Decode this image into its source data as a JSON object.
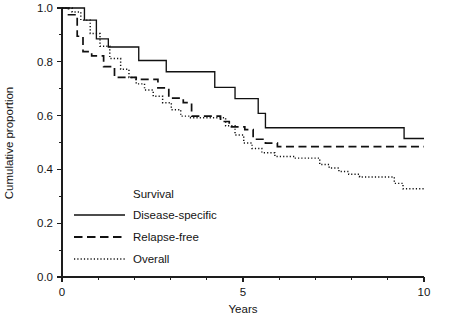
{
  "chart_data": {
    "type": "line",
    "title": "",
    "xlabel": "Years",
    "ylabel": "Cumulative proportion",
    "xlim": [
      0,
      10
    ],
    "ylim": [
      0.0,
      1.0
    ],
    "grid": false,
    "legend_position": "inside-lower-left",
    "legend_title": "Survival",
    "x_ticks_major": [
      0,
      5,
      10
    ],
    "x_tick_labels": [
      "0",
      "5",
      "10"
    ],
    "x_ticks_minor": [
      1,
      2,
      3,
      4,
      6,
      7,
      8,
      9
    ],
    "y_ticks_major": [
      0.0,
      0.2,
      0.4,
      0.6,
      0.8,
      1.0
    ],
    "y_tick_labels": [
      "0.0",
      "0.2",
      "0.4",
      "0.6",
      "0.8",
      "1.0"
    ],
    "y_ticks_minor": [
      0.1,
      0.3,
      0.5,
      0.7,
      0.9
    ],
    "curve_style": "kaplan-meier-step",
    "series": [
      {
        "name": "Disease-specific",
        "style": "solid",
        "color": "#111111",
        "points": [
          [
            0.0,
            1.0
          ],
          [
            0.42,
            1.0
          ],
          [
            0.62,
            0.955
          ],
          [
            0.95,
            0.885
          ],
          [
            1.28,
            0.855
          ],
          [
            1.95,
            0.855
          ],
          [
            2.12,
            0.805
          ],
          [
            2.72,
            0.805
          ],
          [
            2.88,
            0.763
          ],
          [
            4.05,
            0.763
          ],
          [
            4.22,
            0.705
          ],
          [
            4.62,
            0.705
          ],
          [
            4.78,
            0.663
          ],
          [
            5.25,
            0.663
          ],
          [
            5.42,
            0.608
          ],
          [
            5.62,
            0.555
          ],
          [
            9.28,
            0.555
          ],
          [
            9.45,
            0.515
          ],
          [
            10.0,
            0.515
          ]
        ]
      },
      {
        "name": "Relapse-free",
        "style": "dashed",
        "color": "#111111",
        "points": [
          [
            0.0,
            1.0
          ],
          [
            0.18,
            0.975
          ],
          [
            0.42,
            0.895
          ],
          [
            0.58,
            0.838
          ],
          [
            0.82,
            0.822
          ],
          [
            1.15,
            0.782
          ],
          [
            1.45,
            0.742
          ],
          [
            2.05,
            0.735
          ],
          [
            2.48,
            0.735
          ],
          [
            2.65,
            0.703
          ],
          [
            2.95,
            0.665
          ],
          [
            3.35,
            0.648
          ],
          [
            3.58,
            0.598
          ],
          [
            4.05,
            0.598
          ],
          [
            4.38,
            0.578
          ],
          [
            4.62,
            0.558
          ],
          [
            5.05,
            0.548
          ],
          [
            5.28,
            0.512
          ],
          [
            5.62,
            0.498
          ],
          [
            5.95,
            0.485
          ],
          [
            10.0,
            0.485
          ]
        ]
      },
      {
        "name": "Overall",
        "style": "dotted",
        "color": "#111111",
        "points": [
          [
            0.0,
            1.0
          ],
          [
            0.28,
            0.985
          ],
          [
            0.52,
            0.955
          ],
          [
            0.78,
            0.905
          ],
          [
            1.05,
            0.858
          ],
          [
            1.32,
            0.812
          ],
          [
            1.62,
            0.772
          ],
          [
            1.85,
            0.742
          ],
          [
            2.05,
            0.718
          ],
          [
            2.28,
            0.695
          ],
          [
            2.52,
            0.672
          ],
          [
            2.78,
            0.648
          ],
          [
            3.02,
            0.622
          ],
          [
            3.28,
            0.598
          ],
          [
            3.52,
            0.592
          ],
          [
            4.25,
            0.592
          ],
          [
            4.52,
            0.562
          ],
          [
            4.78,
            0.528
          ],
          [
            5.02,
            0.498
          ],
          [
            5.25,
            0.478
          ],
          [
            5.52,
            0.462
          ],
          [
            5.88,
            0.448
          ],
          [
            6.42,
            0.442
          ],
          [
            6.88,
            0.442
          ],
          [
            7.12,
            0.418
          ],
          [
            7.38,
            0.405
          ],
          [
            7.65,
            0.392
          ],
          [
            7.92,
            0.382
          ],
          [
            8.22,
            0.372
          ],
          [
            8.95,
            0.372
          ],
          [
            9.18,
            0.348
          ],
          [
            9.42,
            0.328
          ],
          [
            10.0,
            0.325
          ]
        ]
      }
    ]
  },
  "legend": {
    "title": "Survival",
    "entries": [
      {
        "label": "Disease-specific",
        "style": "solid"
      },
      {
        "label": "Relapse-free",
        "style": "dashed"
      },
      {
        "label": "Overall",
        "style": "dotted"
      }
    ]
  },
  "axes": {
    "y_title": "Cumulative proportion",
    "x_title": "Years",
    "y_labels": [
      "1.0",
      "0.8",
      "0.6",
      "0.4",
      "0.2",
      "0.0"
    ],
    "x_labels": [
      "0",
      "5",
      "10"
    ]
  }
}
